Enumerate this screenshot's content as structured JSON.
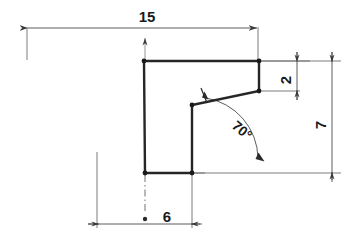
{
  "drawing": {
    "title": "Engineering dimensioned profile sketch",
    "background_color": "#ffffff",
    "object_line_color": "#262626",
    "dimension_line_color": "#6e6e6e",
    "text_color": "#1a1a1a",
    "dimensions": [
      {
        "id": "width-15",
        "label": "15",
        "orientation": "horizontal",
        "position": "top",
        "text_x": 147,
        "text_y": 22,
        "text_rotation": 0
      },
      {
        "id": "height-2",
        "label": "2",
        "orientation": "vertical",
        "position": "right-upper",
        "text_x": 291,
        "text_y": 80,
        "text_rotation": -90
      },
      {
        "id": "height-7",
        "label": "7",
        "orientation": "vertical",
        "position": "right-outer",
        "text_x": 326,
        "text_y": 125,
        "text_rotation": -90
      },
      {
        "id": "width-6",
        "label": "6",
        "orientation": "horizontal",
        "position": "bottom",
        "text_x": 167,
        "text_y": 222,
        "text_rotation": 0
      },
      {
        "id": "angle-70",
        "label": "70°",
        "orientation": "angular",
        "position": "interior",
        "text_x": 239,
        "text_y": 134,
        "text_rotation": 40
      }
    ],
    "profile": {
      "vertices": [
        {
          "name": "top-left",
          "x": 144,
          "y": 61
        },
        {
          "name": "top-right",
          "x": 259,
          "y": 61
        },
        {
          "name": "step-right",
          "x": 259,
          "y": 91
        },
        {
          "name": "slant-left",
          "x": 192,
          "y": 105
        },
        {
          "name": "inner-bottom",
          "x": 192,
          "y": 173
        },
        {
          "name": "bottom-left",
          "x": 145,
          "y": 173
        }
      ],
      "path": "M 144,61 L 259,61 L 259,91 L 192,105 L 192,173 L 145,173 Z"
    }
  }
}
